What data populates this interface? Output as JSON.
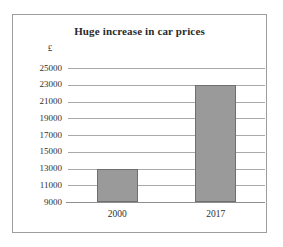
{
  "chart_data": {
    "type": "bar",
    "title": "Huge increase in car prices",
    "xlabel": "",
    "ylabel": "£",
    "categories": [
      "2000",
      "2017"
    ],
    "values": [
      13000,
      23000
    ],
    "series": [
      {
        "name": "Car price",
        "values": [
          13000,
          23000
        ]
      }
    ],
    "ylim": [
      9000,
      25000
    ],
    "ytick_step": 2000,
    "yticks": [
      25000,
      23000,
      21000,
      19000,
      17000,
      15000,
      13000,
      11000,
      9000
    ],
    "ytick_labels": [
      "25000",
      "23000",
      "21000",
      "19000",
      "17000",
      "15000",
      "13000",
      "11000",
      "9000"
    ],
    "grid": true,
    "legend": null,
    "bar_color": "#9a9a9a",
    "bar_edge_color": "#6f6f6f",
    "gridline_color": "#a9a9a9",
    "axis_color": "#8e8e8e",
    "frame_color": "#9d9d9d",
    "text_color": "#2f2f2f",
    "title_color": "#2b2b2b",
    "annotations": []
  }
}
